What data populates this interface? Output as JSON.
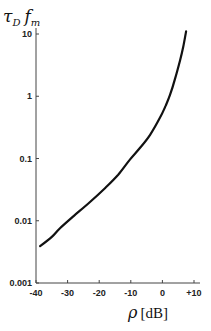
{
  "chart_data": {
    "type": "line",
    "title": "",
    "ylabel": "τ_D f_m",
    "ylabel_main": "τ",
    "ylabel_sub1": "D",
    "ylabel_f": "f",
    "ylabel_sub2": "m",
    "xlabel": "ρ [dB]",
    "xlabel_symbol": "ρ",
    "xlabel_unit": "[dB]",
    "xlim": [
      -40,
      10
    ],
    "ylim": [
      0.001,
      10
    ],
    "yscale": "log",
    "grid": false,
    "legend": null,
    "x_ticks": [
      "-40",
      "-30",
      "-20",
      "-10",
      "0",
      "+10"
    ],
    "y_ticks": [
      "0.001",
      "0.01",
      "0.1",
      "1",
      "10"
    ],
    "series": [
      {
        "name": "τ_D f_m vs ρ",
        "x": [
          -38.7,
          -35,
          -32.4,
          -28,
          -22.9,
          -18,
          -14,
          -10.3,
          -7,
          -3.9,
          -0.8,
          1,
          2.4,
          4,
          5.6,
          6.6,
          7.5
        ],
        "y": [
          0.0039,
          0.0055,
          0.0076,
          0.012,
          0.02,
          0.034,
          0.055,
          0.096,
          0.15,
          0.24,
          0.45,
          0.7,
          1.05,
          1.9,
          3.8,
          6.3,
          11
        ]
      }
    ]
  }
}
